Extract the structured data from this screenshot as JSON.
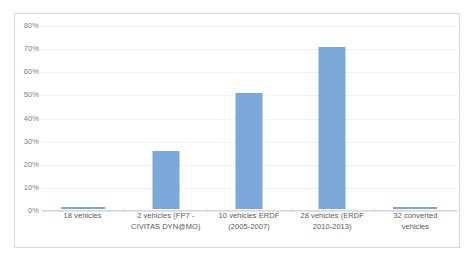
{
  "chart_data": {
    "type": "bar",
    "title": "",
    "subtitle": "",
    "xlabel": "",
    "ylabel": "",
    "categories": [
      "18 vehicles",
      "2 vehicles (FP7 - CIVITAS DYN@MO)",
      "10 vehicles ERDF (2005-2007)",
      "28 vehicles (ERDF 2010-2013)",
      "32 converted vehicles"
    ],
    "category_lines": [
      [
        "18 vehicles"
      ],
      [
        "2 vehicles (FP7 -",
        "CIVITAS DYN@MO)"
      ],
      [
        "10 vehicles ERDF",
        "(2005-2007)"
      ],
      [
        "28 vehicles (ERDF",
        "2010-2013)"
      ],
      [
        "32 converted",
        "vehicles"
      ]
    ],
    "values": [
      0.5,
      25,
      50,
      70,
      0.5
    ],
    "value_labels": [
      "0%",
      "25%",
      "50%",
      "70%",
      "0%"
    ],
    "ylim": [
      0,
      80
    ],
    "ytick_values": [
      0,
      10,
      20,
      30,
      40,
      50,
      60,
      70,
      80
    ],
    "ytick_labels": [
      "0%",
      "10%",
      "20%",
      "30%",
      "40%",
      "50%",
      "60%",
      "70%",
      "80%"
    ],
    "grid": true,
    "legend": false,
    "legend_position": "none",
    "series": [
      {
        "name": "",
        "values": [
          0.5,
          25,
          50,
          70,
          0.5
        ]
      }
    ],
    "colors": {
      "bar_fill": "#7aa8d9",
      "gridline": "#f2f2f2",
      "axis_line": "#d9d9d9",
      "tick_text": "#808080",
      "category_text": "#595959",
      "plot_background": "#ffffff",
      "frame_border": "#d9d9d9"
    }
  }
}
